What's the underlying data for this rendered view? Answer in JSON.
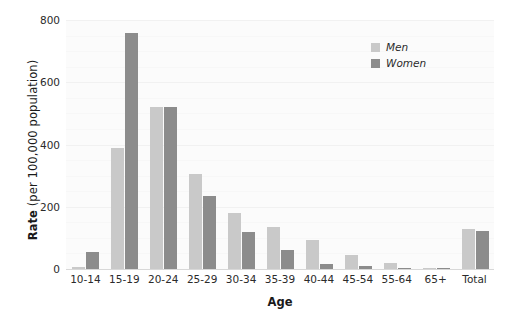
{
  "chart_data": {
    "type": "bar",
    "title": "",
    "subtitle": "",
    "xlabel": "Age",
    "ylabel_bold": "Rate",
    "ylabel_rest": " (per 100,000 population)",
    "ylabel": "Rate (per 100,000 population)",
    "categories": [
      "10-14",
      "15-19",
      "20-24",
      "25-29",
      "30-34",
      "35-39",
      "40-44",
      "45-54",
      "55-64",
      "65+",
      "Total"
    ],
    "series": [
      {
        "name": "Men",
        "color": "#c9c9c9",
        "values": [
          5,
          390,
          520,
          305,
          180,
          134,
          92,
          46,
          20,
          3,
          128
        ]
      },
      {
        "name": "Women",
        "color": "#8c8c8c",
        "values": [
          55,
          757,
          521,
          233,
          118,
          62,
          16,
          10,
          4,
          1,
          121
        ]
      }
    ],
    "ylim": [
      0,
      800
    ],
    "yticks": [
      0,
      200,
      400,
      600,
      800
    ],
    "ytick_labels": [
      "0",
      "200",
      "400",
      "600",
      "800"
    ],
    "grid": true,
    "grid_axis": "y",
    "legend_position": "top-right",
    "legend_entries": [
      "Men",
      "Women"
    ],
    "plot_background": "#fbfbfb",
    "figure_background": "#ffffff"
  }
}
